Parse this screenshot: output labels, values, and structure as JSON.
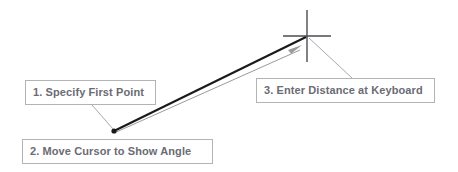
{
  "diagram": {
    "background_color": "#ffffff",
    "callout_border_color": "#b3b3b6",
    "callout_text_color": "#6b6b74",
    "rubber_band_color": "#1a1a1a",
    "angle_line_color": "#9a9a9e",
    "leader_color": "#a9a9ad",
    "crosshair_color": "#4d4d52",
    "point_marker_color": "#1a1a1a"
  },
  "callouts": [
    {
      "id": "specify-first-point",
      "label": "1. Specify First Point"
    },
    {
      "id": "move-cursor-show-angle",
      "label": "2. Move Cursor to Show Angle"
    },
    {
      "id": "enter-distance-keyboard",
      "label": "3. Enter Distance at Keyboard"
    }
  ],
  "graphics": {
    "first_point": {
      "x": 114,
      "y": 131
    },
    "crosshair_center": {
      "x": 307,
      "y": 36
    },
    "crosshair_half_width": 24,
    "crosshair_half_height": 26,
    "rubber_band": {
      "x1": 114,
      "y1": 131,
      "x2": 306,
      "y2": 37
    },
    "angle_line": {
      "x1": 114,
      "y1": 133,
      "x2": 300,
      "y2": 49
    },
    "arrowhead_tip": {
      "x": 301,
      "y": 46
    },
    "leader_1": {
      "x1": 92,
      "y1": 105,
      "x2": 113,
      "y2": 130
    },
    "leader_3": {
      "x1": 308,
      "y1": 38,
      "x2": 352,
      "y2": 78
    }
  }
}
